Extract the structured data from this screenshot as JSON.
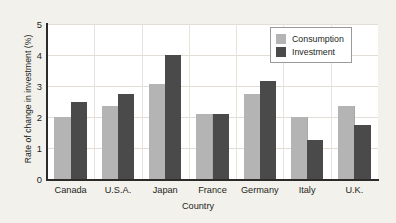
{
  "chart_data": {
    "type": "bar",
    "title": "",
    "xlabel": "Country",
    "ylabel": "Rate of change in investment (%)",
    "categories": [
      "Canada",
      "U.S.A.",
      "Japan",
      "France",
      "Germany",
      "Italy",
      "U.K."
    ],
    "series": [
      {
        "name": "Consumption",
        "color": "#b4b4b4",
        "values": [
          2.0,
          2.35,
          3.05,
          2.1,
          2.75,
          2.0,
          2.35
        ]
      },
      {
        "name": "Investment",
        "color": "#4a4a4a",
        "values": [
          2.5,
          2.75,
          4.0,
          2.1,
          3.15,
          1.25,
          1.75
        ]
      }
    ],
    "ylim": [
      0,
      5
    ],
    "yticks": [
      0,
      1,
      2,
      3,
      4,
      5
    ],
    "ytick_labels": [
      "0",
      "1",
      "2",
      "3",
      "4",
      "5"
    ],
    "grid": true,
    "legend_position": "top-right"
  },
  "legend": {
    "entries": [
      {
        "label": "Consumption"
      },
      {
        "label": "Investment"
      }
    ]
  },
  "colors": {
    "background": "#f2f1ec",
    "plot_background": "#ffffff",
    "axis": "#2b2b2b",
    "grid": "#e2ded6",
    "consumption": "#b4b4b4",
    "investment": "#4a4a4a",
    "text": "#231f20"
  }
}
